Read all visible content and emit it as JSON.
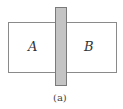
{
  "diagram": {
    "regions": [
      {
        "id": "A",
        "label": "A"
      },
      {
        "id": "B",
        "label": "B"
      }
    ],
    "separator": "shaded-partition",
    "caption": "(a)",
    "colors": {
      "outline": "#8a8a8a",
      "partition_fill": "#c4c4c4"
    }
  }
}
